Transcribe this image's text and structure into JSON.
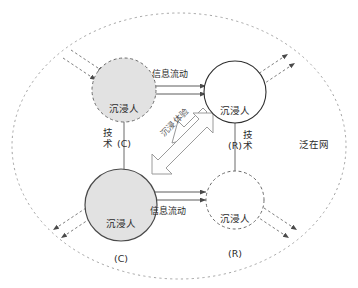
{
  "diagram": {
    "outer_label": "泛在网",
    "accent_fill": "#e2e2e2",
    "stroke_color": "#3a3a3a",
    "nodes": [
      {
        "id": "top-left",
        "line1": "沉浸人",
        "line2": "(C)",
        "style": "dashed-filled"
      },
      {
        "id": "top-right",
        "line1": "沉浸人",
        "line2": "(R)",
        "style": "solid-white"
      },
      {
        "id": "bottom-left",
        "line1": "沉浸人",
        "line2": "(C)",
        "style": "solid-filled"
      },
      {
        "id": "bottom-right",
        "line1": "沉浸人",
        "line2": "(R)",
        "style": "dashed-white"
      }
    ],
    "edges": [
      {
        "id": "top-flow",
        "label": "信息流动",
        "kind": "bidirectional-double-line"
      },
      {
        "id": "bottom-flow",
        "label": "信息流动",
        "kind": "bidirectional-double-line"
      },
      {
        "id": "left-tech",
        "label": "技术",
        "kind": "vertical-line"
      },
      {
        "id": "right-tech",
        "label": "技术",
        "kind": "vertical-line"
      },
      {
        "id": "diagonal",
        "label": "沉浸体验",
        "kind": "hollow-double-arrow"
      }
    ],
    "external_arrows": {
      "count": 8,
      "kind": "dashed-arrow"
    }
  }
}
